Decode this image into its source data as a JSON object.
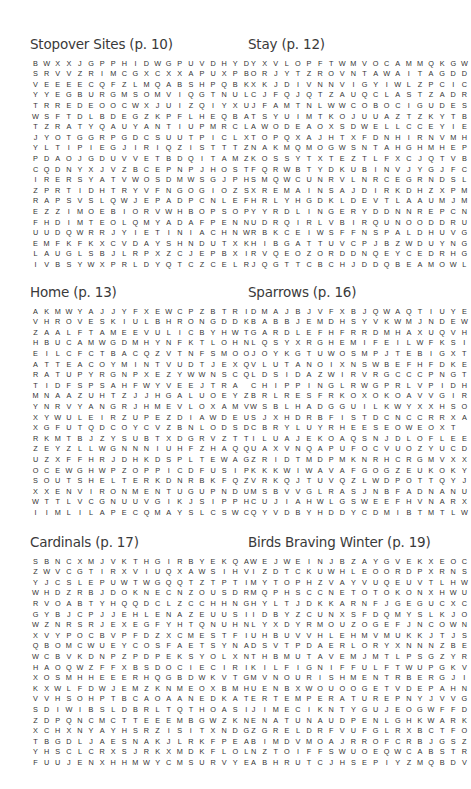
{
  "puzzles": [
    {
      "title": "Stopover Sites (p. 10)",
      "rows": [
        "BWXXJGPPHIDWGPUVDHYD",
        "SRVVZRIMCGXCXXAPUXPB",
        "VEEEECQFZLMQABSHPQBK",
        "YYEGBURGMSOMVIQGTNUL",
        "TRREDEOOCWXJUIZQIYXU",
        "WSFTDLBDEGZKPFLHEQBA",
        "TZRATYQAUYANTIUPMRCL",
        "JYOTGGRPGDCSUUTPICLX",
        "YLTIPIEGJIRIQZISTTTZ",
        "PDAOJGDUVVETBDQITAMZ",
        "CQDNYXJVZBCEPNPJHOST",
        "IRERSYATVWOSDMWSGJPH",
        "ZPRTIDHTRYVFNGOGIOZS",
        "RAPSVSLQWJEPADPCNLEF",
        "EZZIMOEBIORVWHBOPSOP",
        "FHDIMTEOLQMYADAFPENN",
        "UUDQWRRJYIETINIACHNW",
        "EMFKFKXCVDAYSHNDUTXK",
        "LAUGLSBJLRPXZCJEPBXI",
        "IVBSYWXPRLDYQTCZCELR"
      ],
      "found_words": [
        "REFORTA",
        "VEGETATION",
        "RECOVER",
        "SITES",
        "PEREGRINATION",
        "REFUEL",
        "DAYS",
        "STOPOVER",
        "MIGRATION"
      ]
    },
    {
      "title": "Stay (p. 12)",
      "rows": [
        "YXVLOPFTWMVOCAMMQKGW",
        "ORJYTZROVNTAWAITAGDD",
        "XKJDIVNNVIGYIWLZPCIC",
        "CJFQJQTZAUQCLASTZADR",
        "JFAMTNLWWCOBOCIGUDES",
        "TSYUIMTKOJUUAZTZKYTB",
        "AWODEAOXSDWELLCCEYIE",
        "TOPQXAJHTXFDNHIRNVMH",
        "NAKMQMOGWSNTAHGHMHEP",
        "KOSSYTXTEZTLFXCJQTVB",
        "FQRWBTYDKUBINVJYGJFC",
        "SMQWCUNRVLNRCEGRNDSL",
        "XREMAINSAJDIRKDHZXPM",
        "HRLYHGDKLDEVTLAAUMJM",
        "YYRDLINGERYDDNNREPCN",
        "UDRQIRLVBIRQUNOODDRU",
        "RBKCEIWSFFNSPALDHUVG",
        "HIBGATTUVCPJBZWDUYNG",
        "RVQEOZORDDNQEYCEDRHG",
        "JQGTTCBCHJDDQBEAMOWL"
      ],
      "found_words": [
        "AWAIT",
        "LAST",
        "DWELL",
        "REMAIN",
        "LINGER",
        "DETERMINE",
        "WAIT",
        "ABIDE",
        "STAY"
      ]
    },
    {
      "title": "Home (p. 13)",
      "rows": [
        "AKMWYAJJYFXEWCPZBTRI",
        "VHROVESKIULBHRONGDDK",
        "ZAALFTAMEEVULICBYHWT",
        "HBUCAMWGDMHYNFKTLOHN",
        "EILCFCTBACQZVTNFSMOO",
        "ATTEACOYMINTVUDTJEXQ",
        "RATUPYRGNPXEZYWWNSCQ",
        "TIDFSPSAHFWYVEEJTRA",
        "MNAAZUHTZJJHGALUOEYZ",
        "YNRVYANGRJHMEVLOXAMV",
        "XYWULEIRZUPEZDIAWDEU",
        "XGFUTQDCOYCVZBNLODSD",
        "RKMTBJZYSUBTXDGRVZTT",
        "ZEYZLLWGNNNIUHFZHAQQ",
        "UZXFFHRJDHKDSPLTEWAG",
        "OCEWGHWPZOPPICDFUSIP",
        "SOUTSHELTERKDNRBKFQZ",
        "XXENVIRONMENTUGUPNDU",
        "WTTLVCGNUUVGIKJSIPPH",
        "IIMLILAPECQMAYSLCSWC"
      ],
      "found_words": [
        "HEART",
        "HABITAT",
        "DOMESTIC",
        "DWELLING",
        "NEST",
        "SHELTER",
        "ENVIRONMENT",
        "HOUSE",
        "PLACE"
      ]
    },
    {
      "title": "Sparrows (p. 16)",
      "rows": [
        "DMAJBJVFXBJQWAQTIUYE",
        "BABBJEMDHSYVKWMJNDEW",
        "GARDLEFHFRRDMHAXUQVH",
        "LQSYXRGHEMIFEILWFKSI",
        "JOYKGTUWOSMPJTEBIGXT",
        "VLUTANOIXNSWBEFHFDKE",
        "LDSIDAZWIRVRGCCCPNGT",
        "CHIPPINGLRWGPRLVPIDH",
        "BRLRESFRKOXOKOAVVGIR",
        "WSBLHADGGUILKWYXXHSO",
        "SJXHDRBFISTDCNCCRRXA",
        "CBRYLUYRHEESEOWEOXT",
        "ILUAJEKOAQSNJDLOFLEE",
        "UAXVNQAPUFOCVUOZYUCD",
        "ZRIDTMDPMKNRHCRGMVXX",
        "KKKWIWAVAFGOGZEUKOKY",
        "VRKQJTUVQZLWDPOTTQYJ",
        "MSBVVGLRASJNBFADNANU",
        "CUJIAHWLGSWEEFHVNARX",
        "QYVDBYHDDYCDMIBTMTLW"
      ],
      "found_words": [
        "EASTERN",
        "CHIPPING",
        "WHITETHROATED",
        "SONG",
        "HOUSE",
        "SONG",
        "COLORED",
        "CLAYCOLORED",
        "LARK",
        "BREWER",
        "BREWER",
        "SOUTH",
        "WHITECROWNED"
      ]
    },
    {
      "title": "Cardinals (p. 17)",
      "rows": [
        "SBNCXMJVKTHGIRBYEKQA",
        "ZWVCGTIRXVIUQXAWSIHV",
        "YJCSLEPUWTWGQQTZTPTI",
        "WHDZRBJDOKNECNZOUSDR",
        "RVOABTYHQQDCLZCCHHNG",
        "GYBJCPJJEHLENAZEUUSI",
        "WZNRSRJEXEGFYHTQNUHN",
        "XVYPOCBVPFDZXCMESTFI",
        "QBOMCWUEYCOSFAETSYNA",
        "WCBVKDNPZPDPEKSYOLXN",
        "HAOQWZFFXBSDOCIECIRI",
        "XOSMHHEEERHQGBDWKVTG",
        "KXWLFDWJEMZKNMEOXBMH",
        "VVHSOHPTBCAOAANEDKAT",
        "SDIWIBSLDBRLTQTHOASI",
        "ZDPQNCMCTTEEEMBGWZKN",
        "XCHXNYAYHSRZISITXNDG",
        "TBGDLJAESNAKJLRKFPEA",
        "YHSCLCRXSJRKXMDKFLOL",
        "FUUJENXHHMWYCMSURVYE"
      ],
      "found_words": [
        "BRIGHT",
        "VIRGINIA",
        "NIGHTINGALE",
        "CREST",
        "MASK",
        "BIRDS",
        "SONG",
        "SEEDS",
        "CROWNS",
        "REDBIRD",
        "SEEDS"
      ]
    },
    {
      "title": "Birds Braving Winter (p. 19)",
      "rows": [
        "WEJWEINJBZAYGVEKXEOC",
        "IZDTCKUWHLEOORDPXRNS",
        "MYTOPHZVAYVUQEUVTLHW",
        "MQPHSCCNETOTOKONXHWU",
        "HYLTJDKKARNFJGEGUCXC",
        "IDBYZCUNXSFDQMYSLKJO",
        "LYXDYRMOUZOGEFJNCOWN",
        "UHBUVVHLEHMVMUKKJTJS",
        "DSVTPDAERLORYXNNNZBE",
        "THBMUTAVEMJMTLPSGZYR",
        "KILFIGNIFFULFTWUPGKV",
        "MVNOURISHMENTRBERGJI",
        "UENBXWOUOOGETVDEPAHN",
        "ERTEMPERATUREPNYJVVG",
        "JIMECIKNTYGUJEOGWFFD",
        "ENATUNAUDPENLGHKWARK",
        "ZGRELDRFVUFGLRXBCTFO",
        "BIMDVMOAJRROFCRBJGSZ",
        "NZTOIFFSWUOEQWCABSTR",
        "ABHRUTCJHSEPIYZMQBDV"
      ],
      "found_words": [
        "CONSERVING",
        "SHIVERING",
        "ENGULF",
        "NOURISHMENT",
        "TEMPERATURE",
        "WARMTH",
        "METABOLISM",
        "FLUFF",
        "ENERGY",
        "TORPOR"
      ]
    }
  ]
}
